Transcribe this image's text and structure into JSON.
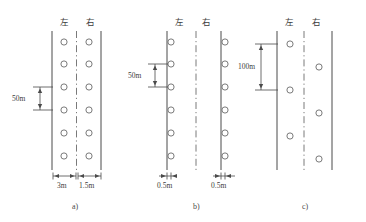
{
  "figure": {
    "type": "engineering-layout-diagram",
    "panels": [
      {
        "id": "a",
        "caption": "a)",
        "headers": {
          "left": "左",
          "right": "右"
        },
        "dimensions": {
          "vertical": "50m",
          "bottom_left": "3m",
          "bottom_right": "1.5m"
        },
        "marker_rows": 6,
        "left_markers": 6,
        "right_markers": 6,
        "marker_placement": "offset-inside-from-bore-lines",
        "centerline_style": "dash-dot"
      },
      {
        "id": "b",
        "caption": "b)",
        "headers": {
          "left": "左",
          "right": "右"
        },
        "dimensions": {
          "vertical": "50m",
          "bottom_left": "0.5m",
          "bottom_right": "0.5m"
        },
        "marker_rows": 6,
        "left_markers": 6,
        "right_markers": 6,
        "marker_placement": "on-bore-lines",
        "centerline_style": "dash-dot"
      },
      {
        "id": "c",
        "caption": "c)",
        "headers": {
          "left": "左",
          "right": "右"
        },
        "dimensions": {
          "vertical": "100m"
        },
        "marker_rows": 7,
        "left_markers": 3,
        "right_markers": 4,
        "marker_placement": "staggered-alternating",
        "centerline_style": "dash-dot"
      }
    ],
    "colors": {
      "line": "#4a4a4a",
      "marker_stroke": "#6b6b6b",
      "text": "#3c3c3c",
      "background": "#ffffff"
    }
  }
}
